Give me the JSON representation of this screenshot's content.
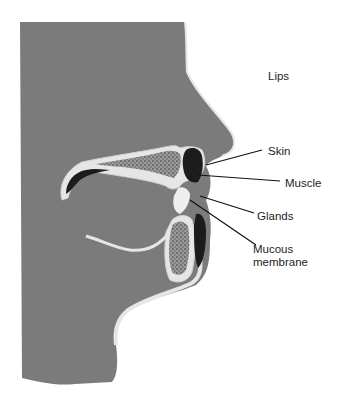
{
  "figure": {
    "labels": [
      {
        "id": "lips",
        "text": "Lips",
        "x": 268,
        "y": 70
      },
      {
        "id": "skin",
        "text": "Skin",
        "x": 268,
        "y": 145
      },
      {
        "id": "muscle",
        "text": "Muscle",
        "x": 285,
        "y": 177
      },
      {
        "id": "glands",
        "text": "Glands",
        "x": 257,
        "y": 210
      },
      {
        "id": "mucous",
        "text": "Mucous",
        "x": 253,
        "y": 243
      },
      {
        "id": "membrane",
        "text": "membrane",
        "x": 253,
        "y": 256
      }
    ],
    "labels_text": {
      "lips": "Lips",
      "skin": "Skin",
      "muscle": "Muscle",
      "glands": "Glands",
      "mucous_line1": "Mucous",
      "mucous_line2": "membrane"
    },
    "colors": {
      "background": "#ffffff",
      "tissue_gray": "#7b7b7b",
      "outline_light": "#e6e6e6",
      "bone_speckle": "#8d8d8d",
      "muscle_dark": "#1c1c1c",
      "leader_line": "#111111",
      "text": "#1e1e1e"
    }
  }
}
